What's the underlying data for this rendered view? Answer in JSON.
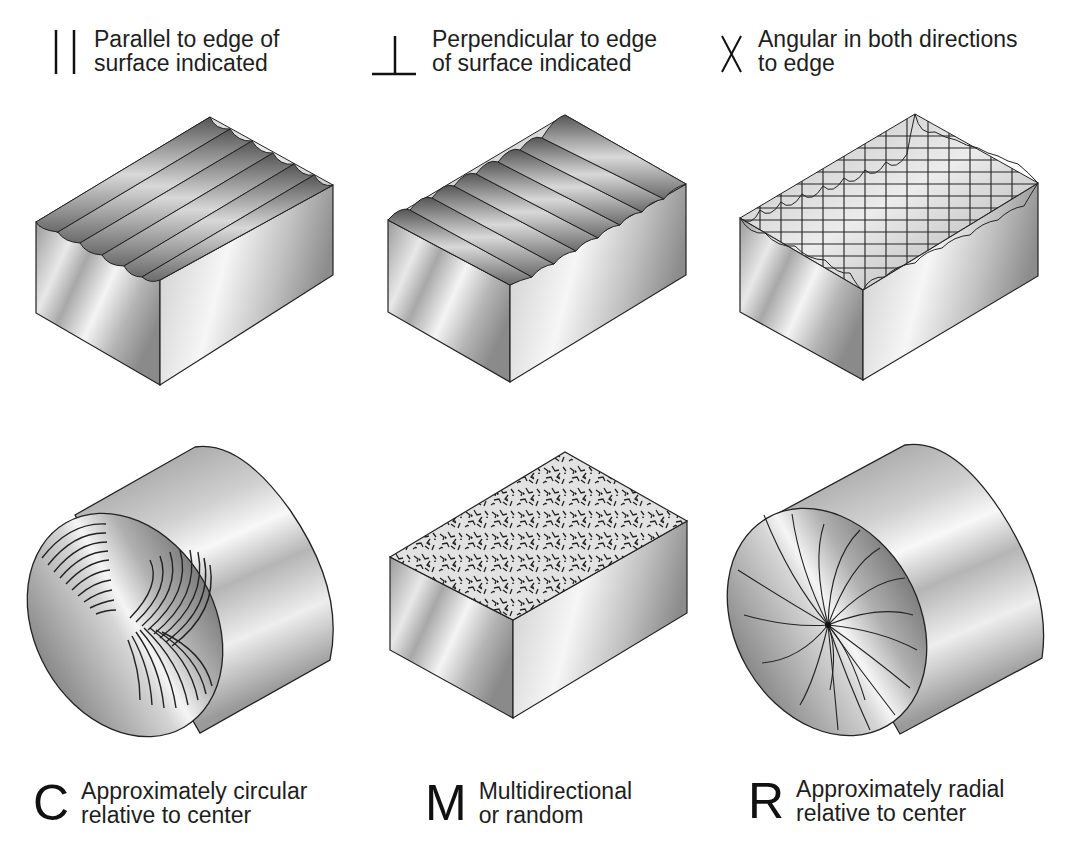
{
  "top_row": [
    {
      "symbol": "parallel-symbol",
      "line1": "Parallel to edge of",
      "line2": "surface indicated"
    },
    {
      "symbol": "perpendicular-symbol",
      "line1": "Perpendicular to edge",
      "line2": "of surface indicated"
    },
    {
      "symbol": "X",
      "line1": "Angular in both directions",
      "line2": "to edge"
    }
  ],
  "bottom_row": [
    {
      "symbol": "C",
      "line1": "Approximately circular",
      "line2": "relative to center"
    },
    {
      "symbol": "M",
      "line1": "Multidirectional",
      "line2": "or random"
    },
    {
      "symbol": "R",
      "line1": "Approximately radial",
      "line2": "relative to center"
    }
  ],
  "illustrations": [
    {
      "name": "block-parallel-lay",
      "shape": "rectangular block",
      "texture": "parallel grooves"
    },
    {
      "name": "block-perpendicular-lay",
      "shape": "rectangular block",
      "texture": "perpendicular grooves"
    },
    {
      "name": "block-angular-lay",
      "shape": "rectangular block",
      "texture": "crosshatch"
    },
    {
      "name": "cylinder-circular-lay",
      "shape": "cylinder",
      "texture": "concentric arcs"
    },
    {
      "name": "block-multidirectional-lay",
      "shape": "rectangular block",
      "texture": "random"
    },
    {
      "name": "cylinder-radial-lay",
      "shape": "cylinder",
      "texture": "radial curves"
    }
  ]
}
